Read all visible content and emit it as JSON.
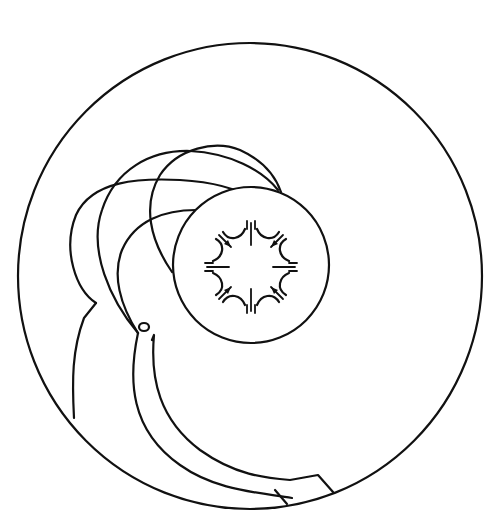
{
  "diagram": {
    "type": "line-art schematic",
    "colors": {
      "stroke": "#111111",
      "background": "#ffffff"
    },
    "outer_circle": {
      "cx": 250,
      "cy": 275,
      "r": 232
    },
    "inner_circle": {
      "cx": 251,
      "cy": 265,
      "r": 78
    },
    "star_pattern": {
      "arms": 8,
      "arrow_count": 8,
      "center": [
        251,
        265
      ]
    },
    "labels": []
  }
}
